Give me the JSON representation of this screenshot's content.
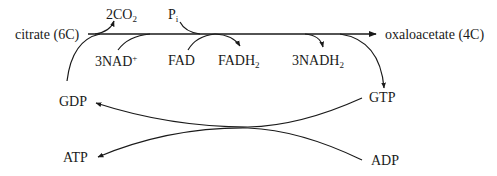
{
  "diagram": {
    "type": "metabolic-pathway",
    "main_flow": {
      "start": "citrate (6C)",
      "end": "oxaloacetate (4C)"
    },
    "labels": {
      "citrate": "citrate (6C)",
      "oxaloacetate": "oxaloacetate (4C)",
      "co2": {
        "base": "2CO",
        "sub": "2"
      },
      "pi": {
        "base": "P",
        "sub": "i"
      },
      "nad": {
        "base": "3NAD",
        "sup": "+"
      },
      "fad": "FAD",
      "fadh2": {
        "base": "FADH",
        "sub": "2"
      },
      "nadh2": {
        "base": "3NADH",
        "sub": "2"
      },
      "gdp": "GDP",
      "gtp": "GTP",
      "atp": "ATP",
      "adp": "ADP"
    },
    "colors": {
      "line": "#1a1a1a",
      "background": "#ffffff"
    },
    "edges": [
      {
        "from": "citrate (6C)",
        "to": "oxaloacetate (4C)",
        "kind": "main-arrow"
      },
      {
        "from": "main-line",
        "to": "2CO2",
        "kind": "product-out"
      },
      {
        "from": "Pi",
        "to": "main-line",
        "kind": "input-in"
      },
      {
        "from": "3NAD+",
        "to": "main-line",
        "kind": "input-in"
      },
      {
        "from": "FAD",
        "to": "main-line",
        "kind": "input-in"
      },
      {
        "from": "main-line",
        "to": "FADH2",
        "kind": "product-out"
      },
      {
        "from": "main-line",
        "to": "3NADH2",
        "kind": "product-out"
      },
      {
        "from": "main-line",
        "to": "GTP",
        "kind": "product-out"
      },
      {
        "from": "GDP",
        "to": "main-line",
        "kind": "input-in"
      },
      {
        "from": "GTP",
        "to": "GDP",
        "kind": "crossing-arrow"
      },
      {
        "from": "ADP",
        "to": "ATP",
        "kind": "crossing-arrow"
      }
    ]
  }
}
